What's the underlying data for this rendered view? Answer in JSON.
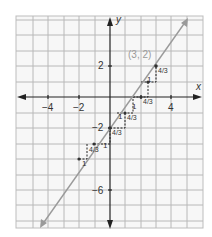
{
  "graph": {
    "x_axis_label": "x",
    "y_axis_label": "y",
    "x_ticks": [
      {
        "value": -4,
        "label": "−4"
      },
      {
        "value": -2,
        "label": "−2"
      },
      {
        "value": 4,
        "label": "4"
      }
    ],
    "y_ticks": [
      {
        "value": 2,
        "label": "2"
      },
      {
        "value": -2,
        "label": "−2"
      },
      {
        "value": -6,
        "label": "−6"
      }
    ],
    "point_label": "(3, 2)",
    "line": {
      "slope": "4/3",
      "y_intercept": -2,
      "color": "#9a9a9a"
    },
    "step_run_label": "1",
    "step_rise_label": "4/3",
    "grid_range": {
      "x": [
        -6,
        6
      ],
      "y": [
        -8,
        5
      ]
    },
    "colors": {
      "grid": "#b0b0b0",
      "axis": "#222222",
      "line": "#9a9a9a",
      "background": "#f7f7f7"
    }
  }
}
